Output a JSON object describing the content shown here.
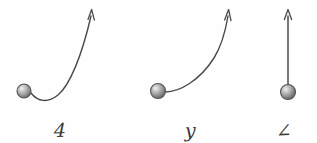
{
  "figure": {
    "kind": "hand-drawn-physics-diagram",
    "background_color": "#fefefe",
    "ink_color": "#4a4a4a",
    "ball_color_light": "#e8e8e8",
    "ball_color_dark": "#6e6e6e",
    "ball_outline_color": "#555555",
    "panels": [
      {
        "id": "a",
        "label": "4",
        "path_type": "dip-then-steep-rise",
        "description": "ball at lower left, trajectory dips slightly below then curves sharply upward to arrow at top",
        "ball": {
          "cx": 24,
          "cy": 91,
          "r": 7
        },
        "arrow_tip": {
          "x": 93,
          "y": 9
        },
        "path": "M 31 93 C 38 102, 48 103, 58 95 C 70 85, 82 55, 91 16"
      },
      {
        "id": "b",
        "label": "y",
        "path_type": "smooth-concave-up-rise",
        "description": "ball at lower left, trajectory leaves horizontally then curves smoothly upward to arrow at upper right",
        "ball": {
          "cx": 28,
          "cy": 91,
          "r": 7
        },
        "arrow_tip": {
          "x": 100,
          "y": 9
        },
        "path": "M 35 92 C 50 92, 70 80, 84 58 C 92 45, 96 28, 98 16"
      },
      {
        "id": "c",
        "label": "∠",
        "path_type": "straight-vertical-rise",
        "description": "ball at bottom, straight vertical line upward to arrow at top",
        "ball": {
          "cx": 38,
          "cy": 92,
          "r": 7
        },
        "arrow_tip": {
          "x": 38,
          "y": 9
        },
        "path": "M 38 85 L 38 16"
      }
    ]
  }
}
